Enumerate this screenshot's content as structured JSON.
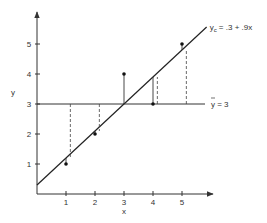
{
  "chart_data": {
    "type": "scatter",
    "title": "",
    "xlabel": "x",
    "ylabel": "y",
    "x_ticks": [
      "1",
      "2",
      "3",
      "4",
      "5"
    ],
    "y_ticks": [
      "1",
      "2",
      "3",
      "4",
      "5"
    ],
    "xlim": [
      0,
      6.1
    ],
    "ylim": [
      0,
      5.8
    ],
    "grid": false,
    "points": [
      {
        "x": 1,
        "y": 1
      },
      {
        "x": 2,
        "y": 2
      },
      {
        "x": 3,
        "y": 4
      },
      {
        "x": 4,
        "y": 3
      },
      {
        "x": 5,
        "y": 5
      }
    ],
    "regression": {
      "intercept": 0.3,
      "slope": 0.9,
      "x_range": [
        0,
        5.85
      ],
      "label": "y_c = .3 + .9x",
      "label_main": "y",
      "label_sub": "c",
      "label_rest": " = .3 + .9x"
    },
    "mean_line": {
      "y": 3,
      "label": "ȳ = 3",
      "label_main": "y",
      "label_rest": " = 3"
    },
    "dashed_offset_x": 0.15,
    "annotations": [
      "solid segments: observed y to fitted y_c",
      "dashed segments: mean ȳ to fitted y_c"
    ]
  }
}
